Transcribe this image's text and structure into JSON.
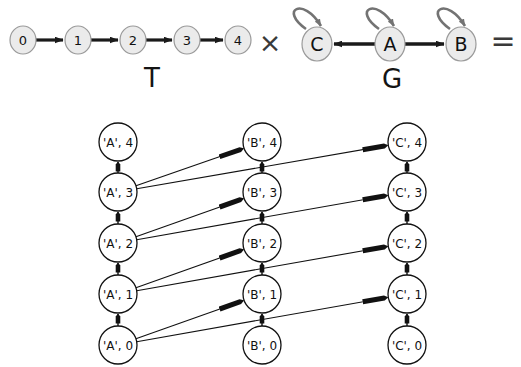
{
  "figure": {
    "operator_times": "×",
    "operator_equals": "=",
    "colors": {
      "small_node_fill": "#ebebeb",
      "small_node_stroke": "#9a9a9a",
      "small_edge": "#1a1a1a",
      "self_loop": "#737373",
      "product_node_fill": "#ffffff",
      "product_node_stroke": "#111111",
      "product_edge": "#111111",
      "text": "#111111"
    }
  },
  "graph_T": {
    "label": "T",
    "label_x": 152,
    "label_y": 80,
    "nodes": [
      {
        "id": "0",
        "label": "0",
        "cx": 23,
        "cy": 40
      },
      {
        "id": "1",
        "label": "1",
        "cx": 78,
        "cy": 40
      },
      {
        "id": "2",
        "label": "2",
        "cx": 133,
        "cy": 40
      },
      {
        "id": "3",
        "label": "3",
        "cx": 187,
        "cy": 40
      },
      {
        "id": "4",
        "label": "4",
        "cx": 238,
        "cy": 40
      }
    ],
    "edges": [
      {
        "from": "0",
        "to": "1"
      },
      {
        "from": "1",
        "to": "2"
      },
      {
        "from": "2",
        "to": "3"
      },
      {
        "from": "3",
        "to": "4"
      }
    ]
  },
  "graph_G": {
    "label": "G",
    "label_x": 392,
    "label_y": 80,
    "nodes": [
      {
        "id": "C",
        "label": "C",
        "cx": 317,
        "cy": 44
      },
      {
        "id": "A",
        "label": "A",
        "cx": 390,
        "cy": 44
      },
      {
        "id": "B",
        "label": "B",
        "cx": 461,
        "cy": 44
      }
    ],
    "edges": [
      {
        "from": "A",
        "to": "C"
      },
      {
        "from": "A",
        "to": "B"
      }
    ],
    "self_loops": [
      "C",
      "A",
      "B"
    ]
  },
  "product_graph": {
    "columns": [
      {
        "state": "A",
        "cx": 118
      },
      {
        "state": "B",
        "cx": 262
      },
      {
        "state": "C",
        "cx": 407
      }
    ],
    "time_steps": [
      0,
      1,
      2,
      3,
      4
    ],
    "row_y": {
      "0": 345,
      "1": 294,
      "2": 243,
      "3": 192,
      "4": 142
    },
    "node_radius": 19,
    "nodes": [
      {
        "id": "A4",
        "label": "'A', 4",
        "col": "A",
        "t": 4,
        "cx": 118,
        "cy": 142
      },
      {
        "id": "A3",
        "label": "'A', 3",
        "col": "A",
        "t": 3,
        "cx": 118,
        "cy": 192
      },
      {
        "id": "A2",
        "label": "'A', 2",
        "col": "A",
        "t": 2,
        "cx": 118,
        "cy": 243
      },
      {
        "id": "A1",
        "label": "'A', 1",
        "col": "A",
        "t": 1,
        "cx": 118,
        "cy": 294
      },
      {
        "id": "A0",
        "label": "'A', 0",
        "col": "A",
        "t": 0,
        "cx": 118,
        "cy": 345
      },
      {
        "id": "B4",
        "label": "'B', 4",
        "col": "B",
        "t": 4,
        "cx": 262,
        "cy": 142
      },
      {
        "id": "B3",
        "label": "'B', 3",
        "col": "B",
        "t": 3,
        "cx": 262,
        "cy": 192
      },
      {
        "id": "B2",
        "label": "'B', 2",
        "col": "B",
        "t": 2,
        "cx": 262,
        "cy": 243
      },
      {
        "id": "B1",
        "label": "'B', 1",
        "col": "B",
        "t": 1,
        "cx": 262,
        "cy": 294
      },
      {
        "id": "B0",
        "label": "'B', 0",
        "col": "B",
        "t": 0,
        "cx": 262,
        "cy": 345
      },
      {
        "id": "C4",
        "label": "'C', 4",
        "col": "C",
        "t": 4,
        "cx": 407,
        "cy": 142
      },
      {
        "id": "C3",
        "label": "'C', 3",
        "col": "C",
        "t": 3,
        "cx": 407,
        "cy": 192
      },
      {
        "id": "C2",
        "label": "'C', 2",
        "col": "C",
        "t": 2,
        "cx": 407,
        "cy": 243
      },
      {
        "id": "C1",
        "label": "'C', 1",
        "col": "C",
        "t": 1,
        "cx": 407,
        "cy": 294
      },
      {
        "id": "C0",
        "label": "'C', 0",
        "col": "C",
        "t": 0,
        "cx": 407,
        "cy": 345
      }
    ],
    "edges_vertical": [
      {
        "from": "A0",
        "to": "A1"
      },
      {
        "from": "A1",
        "to": "A2"
      },
      {
        "from": "A2",
        "to": "A3"
      },
      {
        "from": "A3",
        "to": "A4"
      },
      {
        "from": "B0",
        "to": "B1"
      },
      {
        "from": "B1",
        "to": "B2"
      },
      {
        "from": "B2",
        "to": "B3"
      },
      {
        "from": "B3",
        "to": "B4"
      },
      {
        "from": "C0",
        "to": "C1"
      },
      {
        "from": "C1",
        "to": "C2"
      },
      {
        "from": "C2",
        "to": "C3"
      },
      {
        "from": "C3",
        "to": "C4"
      }
    ],
    "edges_diagonal": [
      {
        "from": "A0",
        "to": "B1"
      },
      {
        "from": "A1",
        "to": "B2"
      },
      {
        "from": "A2",
        "to": "B3"
      },
      {
        "from": "A3",
        "to": "B4"
      },
      {
        "from": "A0",
        "to": "C1"
      },
      {
        "from": "A1",
        "to": "C2"
      },
      {
        "from": "A2",
        "to": "C3"
      },
      {
        "from": "A3",
        "to": "C4"
      }
    ]
  }
}
